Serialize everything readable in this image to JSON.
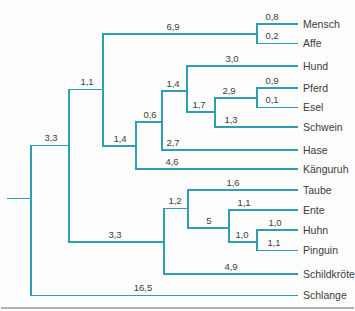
{
  "diagram": {
    "type": "phylogenetic-tree",
    "line_color": "#2f9eb2",
    "text_color": "#3c3c3c",
    "rule_color": "#b2b2b2",
    "taxa": [
      {
        "name": "Mensch",
        "branch_length": "0,8",
        "y": 24,
        "x1": 257,
        "x2": 298,
        "label_cx": 272
      },
      {
        "name": "Affe",
        "branch_length": "0,2",
        "y": 43.5,
        "x1": 257,
        "x2": 298,
        "label_cx": 272
      },
      {
        "name": "Hund",
        "branch_length": "3,0",
        "y": 66,
        "x1": 187,
        "x2": 298,
        "label_cx": 232
      },
      {
        "name": "Pferd",
        "branch_length": "0,9",
        "y": 88,
        "x1": 257,
        "x2": 298,
        "label_cx": 272
      },
      {
        "name": "Esel",
        "branch_length": "0,1",
        "y": 107.5,
        "x1": 257,
        "x2": 298,
        "label_cx": 272
      },
      {
        "name": "Schwein",
        "branch_length": "1,3",
        "y": 127,
        "x1": 215,
        "x2": 298,
        "label_cx": 231
      },
      {
        "name": "Hase",
        "branch_length": "2,7",
        "y": 150,
        "x1": 162,
        "x2": 298,
        "label_cx": 173
      },
      {
        "name": "Känguruh",
        "branch_length": "4,6",
        "y": 169,
        "x1": 136,
        "x2": 298,
        "label_cx": 172
      },
      {
        "name": "Taube",
        "branch_length": "1,6",
        "y": 190,
        "x1": 188,
        "x2": 298,
        "label_cx": 233
      },
      {
        "name": "Ente",
        "branch_length": "1,1",
        "y": 210,
        "x1": 229,
        "x2": 298,
        "label_cx": 244
      },
      {
        "name": "Huhn",
        "branch_length": "1,0",
        "y": 230,
        "x1": 257,
        "x2": 298,
        "label_cx": 275
      },
      {
        "name": "Pinguin",
        "branch_length": "1,1",
        "y": 250.5,
        "x1": 257,
        "x2": 298,
        "label_cx": 274
      },
      {
        "name": "Schildkröte",
        "branch_length": "4,9",
        "y": 274,
        "x1": 164,
        "x2": 298,
        "label_cx": 231
      },
      {
        "name": "Schlange",
        "branch_length": "16,5",
        "y": 295.5,
        "x1": 31,
        "x2": 298,
        "label_cx": 143
      }
    ],
    "internal_branches": [
      {
        "branch_length": "6,9",
        "y": 34,
        "x1": 103,
        "x2": 257,
        "label_cx": 173
      },
      {
        "branch_length": "1,1",
        "y": 89.5,
        "x1": 69,
        "x2": 103,
        "label_cx": 87
      },
      {
        "branch_length": "1,4",
        "y": 91,
        "x1": 162,
        "x2": 187,
        "label_cx": 173
      },
      {
        "branch_length": "2,9",
        "y": 98,
        "x1": 215,
        "x2": 257,
        "label_cx": 229
      },
      {
        "branch_length": "1,7",
        "y": 112,
        "x1": 187,
        "x2": 215,
        "label_cx": 199
      },
      {
        "branch_length": "0,6",
        "y": 122,
        "x1": 136,
        "x2": 162,
        "label_cx": 150
      },
      {
        "branch_length": "3,3",
        "y": 145.5,
        "x1": 31,
        "x2": 69,
        "label_cx": 51
      },
      {
        "branch_length": "1,4",
        "y": 146,
        "x1": 103,
        "x2": 136,
        "label_cx": 120
      },
      {
        "branch_length": "1,2",
        "y": 208.5,
        "x1": 164,
        "x2": 188,
        "label_cx": 175
      },
      {
        "branch_length": "5",
        "y": 228,
        "x1": 188,
        "x2": 229,
        "label_cx": 209
      },
      {
        "branch_length": "1,0",
        "y": 242,
        "x1": 229,
        "x2": 257,
        "label_cx": 242
      },
      {
        "branch_length": "3,3",
        "y": 242,
        "x1": 69,
        "x2": 164,
        "label_cx": 115
      }
    ],
    "connectors": [
      {
        "x": 31,
        "y1": 145.5,
        "y2": 295.5
      },
      {
        "x": 69,
        "y1": 89.5,
        "y2": 242
      },
      {
        "x": 103,
        "y1": 34,
        "y2": 146
      },
      {
        "x": 136,
        "y1": 122,
        "y2": 169
      },
      {
        "x": 162,
        "y1": 91,
        "y2": 150
      },
      {
        "x": 187,
        "y1": 66,
        "y2": 112
      },
      {
        "x": 215,
        "y1": 98,
        "y2": 127
      },
      {
        "x": 257,
        "y1": 24,
        "y2": 43.5
      },
      {
        "x": 257,
        "y1": 88,
        "y2": 107.5
      },
      {
        "x": 164,
        "y1": 208.5,
        "y2": 274
      },
      {
        "x": 188,
        "y1": 190,
        "y2": 228
      },
      {
        "x": 229,
        "y1": 210,
        "y2": 242
      },
      {
        "x": 257,
        "y1": 230,
        "y2": 250.5
      }
    ],
    "root_stub": {
      "y": 198.5,
      "x1": 7,
      "x2": 31
    },
    "baseline_rule": {
      "y": 308,
      "x1": 1,
      "x2": 354
    },
    "taxon_label_x": 303
  }
}
